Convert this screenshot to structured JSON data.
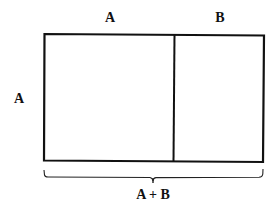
{
  "diagram": {
    "labels": {
      "top_left": "A",
      "top_right": "B",
      "left_side": "A",
      "bottom": "A + B"
    },
    "colors": {
      "stroke": "#111111",
      "background": "#ffffff"
    },
    "geometry": {
      "rect": {
        "x1": 44,
        "y1": 34,
        "x2": 264,
        "y2": 162
      },
      "divider_x": 174,
      "brace_y": 177,
      "brace_tick_x": 153
    }
  }
}
